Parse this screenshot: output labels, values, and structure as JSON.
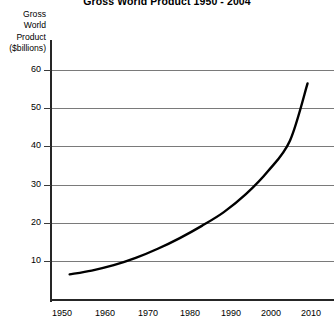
{
  "chart_data": {
    "type": "line",
    "title": "Gross World Product 1950 - 2004",
    "xlabel": "",
    "ylabel": "Gross World Product ($billions)",
    "ylabel_lines": [
      "Gross",
      "World",
      "Product",
      "($billions)"
    ],
    "xlim": [
      1946,
      2010
    ],
    "ylim": [
      0,
      63
    ],
    "xticks": [
      1950,
      1960,
      1970,
      1980,
      1990,
      2000,
      2010
    ],
    "xtick_labels": [
      "1950",
      "1960",
      "1970",
      "1980",
      "1990",
      "2000",
      "2010"
    ],
    "yticks": [
      10,
      20,
      30,
      40,
      50,
      60
    ],
    "ytick_labels": [
      "10",
      "20",
      "30",
      "40",
      "50",
      "60"
    ],
    "grid": true,
    "grid_axis": "y",
    "legend": false,
    "series": [
      {
        "name": "Gross World Product",
        "color": "#000000",
        "x": [
          1950,
          1955,
          1960,
          1965,
          1970,
          1975,
          1980,
          1985,
          1990,
          1995,
          2000,
          2004
        ],
        "values": [
          6.5,
          7.5,
          8.9,
          10.8,
          13.2,
          16.0,
          19.2,
          22.8,
          27.5,
          33.5,
          41.5,
          56.5
        ]
      }
    ]
  },
  "axis_colors": {
    "axis": "#262626",
    "grid": "#7a7a7a",
    "curve": "#000000",
    "background": "#ffffff"
  }
}
